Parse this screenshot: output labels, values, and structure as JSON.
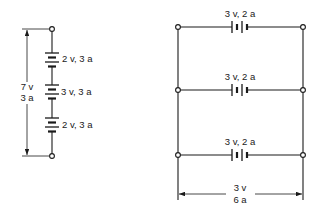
{
  "series_circuit": {
    "description": "Cells in series",
    "cells": [
      {
        "label": "2 v, 3 a",
        "voltage": "2 v",
        "current": "3 a"
      },
      {
        "label": "3 v, 3 a",
        "voltage": "3 v",
        "current": "3 a"
      },
      {
        "label": "2 v, 3 a",
        "voltage": "2 v",
        "current": "3 a"
      }
    ],
    "total": {
      "voltage": "7 v",
      "current": "3 a"
    }
  },
  "parallel_circuit": {
    "description": "Cells in parallel",
    "cells": [
      {
        "label": "3 v, 2 a",
        "voltage": "3 v",
        "current": "2 a"
      },
      {
        "label": "3 v, 2 a",
        "voltage": "3 v",
        "current": "2 a"
      },
      {
        "label": "3 v, 2 a",
        "voltage": "3 v",
        "current": "2 a"
      }
    ],
    "total": {
      "voltage": "3 v",
      "current": "6 a"
    }
  },
  "colors": {
    "ink": "#1a1a1a",
    "background": "#ffffff"
  }
}
